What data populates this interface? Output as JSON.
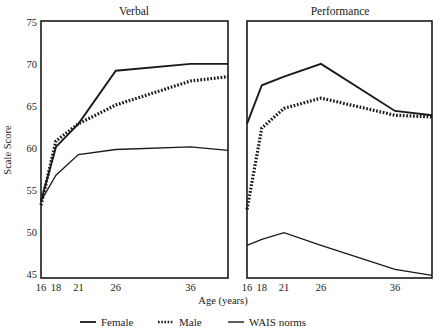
{
  "chart_data": {
    "type": "line",
    "title": "",
    "xlabel": "Age (years)",
    "ylabel": "Scale Score",
    "ylim": [
      45,
      75
    ],
    "yticks": [
      45,
      50,
      55,
      60,
      65,
      70,
      75
    ],
    "x": [
      16,
      18,
      21,
      26,
      36,
      41
    ],
    "xticks": [
      16,
      18,
      21,
      26,
      36
    ],
    "xticklabels": [
      "16",
      "18",
      "21",
      "26",
      "36"
    ],
    "grid": false,
    "legend_position": "bottom",
    "legend": [
      "Female",
      "Male",
      "WAIS norms"
    ],
    "panels": [
      {
        "title": "Verbal",
        "series": [
          {
            "name": "Female",
            "style": "solid",
            "values": [
              54.0,
              60.3,
              63.0,
              69.2,
              70.0,
              70.0
            ]
          },
          {
            "name": "Male",
            "style": "dotted",
            "values": [
              53.5,
              61.0,
              63.0,
              65.2,
              68.0,
              68.5
            ]
          },
          {
            "name": "WAIS norms",
            "style": "thin",
            "values": [
              54.0,
              57.0,
              59.4,
              60.0,
              60.3,
              59.9
            ]
          }
        ]
      },
      {
        "title": "Performance",
        "series": [
          {
            "name": "Female",
            "style": "solid",
            "values": [
              63.0,
              67.5,
              68.5,
              70.0,
              64.5,
              64.0
            ]
          },
          {
            "name": "Male",
            "style": "dotted",
            "values": [
              53.0,
              62.5,
              64.8,
              66.0,
              64.0,
              63.8
            ]
          },
          {
            "name": "WAIS norms",
            "style": "thin",
            "values": [
              48.8,
              49.5,
              50.3,
              48.8,
              46.0,
              45.3
            ]
          }
        ]
      }
    ]
  },
  "axis": {
    "ylabel": "Scale Score",
    "xlabel": "Age (years)",
    "yticks": [
      "45",
      "50",
      "55",
      "60",
      "65",
      "70",
      "75"
    ],
    "xticks": [
      "16",
      "18",
      "21",
      "26",
      "36"
    ]
  },
  "panels": {
    "left_title": "Verbal",
    "right_title": "Performance"
  },
  "legend": {
    "items": [
      {
        "label": "Female",
        "swatch": "solid-line-swatch"
      },
      {
        "label": "Male",
        "swatch": "dotted-line-swatch"
      },
      {
        "label": "WAIS norms",
        "swatch": "solid-line-swatch"
      }
    ]
  },
  "colors": {
    "ink": "#1a1a1a",
    "background": "#ffffff"
  }
}
